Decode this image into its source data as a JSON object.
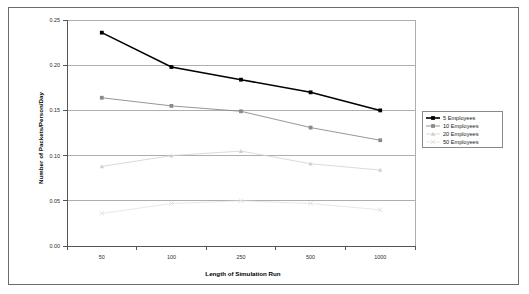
{
  "figure": {
    "border_color": "#6b6b6b"
  },
  "chart_data": {
    "type": "line",
    "title": "",
    "xlabel": "Length of Simulation Run",
    "ylabel": "Number of Packets/Person/Day",
    "categories": [
      "50",
      "100",
      "250",
      "500",
      "1000"
    ],
    "ytick_labels": [
      "0.00",
      "0.05",
      "0.10",
      "0.15",
      "0.20",
      "0.25"
    ],
    "ytick_values": [
      0.0,
      0.05,
      0.1,
      0.15,
      0.2,
      0.25
    ],
    "ylim": [
      0.0,
      0.25
    ],
    "grid": "horizontal",
    "legend_position": "right",
    "series": [
      {
        "name": "5 Employees",
        "color": "#000000",
        "marker": "square",
        "line_width": 1.6,
        "values": [
          0.236,
          0.198,
          0.184,
          0.17,
          0.15
        ]
      },
      {
        "name": "10 Employees",
        "color": "#8a8a8a",
        "marker": "square",
        "line_width": 0.9,
        "values": [
          0.164,
          0.155,
          0.149,
          0.131,
          0.117
        ]
      },
      {
        "name": "20 Employees",
        "color": "#d0d0d0",
        "marker": "triangle",
        "line_width": 0.8,
        "values": [
          0.088,
          0.1,
          0.105,
          0.091,
          0.084
        ]
      },
      {
        "name": "50 Employees",
        "color": "#e2e2e2",
        "marker": "cross",
        "line_width": 0.8,
        "values": [
          0.036,
          0.047,
          0.05,
          0.047,
          0.04
        ]
      }
    ]
  }
}
